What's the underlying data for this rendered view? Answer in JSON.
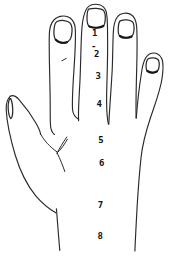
{
  "figure": {
    "alt": "Line drawing of the back of a hand with a numbered measurement scale running down the middle finger and the back of the hand",
    "background_color": "#ffffff",
    "ink_color": "#2a2a2a",
    "label_color": "#111111",
    "scale_labels": [
      "1",
      "2",
      "3",
      "4",
      "5",
      "6",
      "7",
      "8"
    ],
    "dash_mark": "-"
  }
}
